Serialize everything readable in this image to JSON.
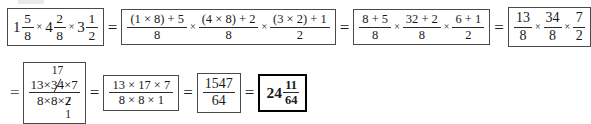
{
  "document": {
    "type": "worked-solution",
    "topic": "Multiplication of mixed numbers",
    "equals_sign": "=",
    "times_sign": "×"
  },
  "row1": {
    "step1": {
      "label": "original-expression",
      "terms": [
        {
          "whole": "1",
          "num": "5",
          "den": "8"
        },
        {
          "whole": "4",
          "num": "2",
          "den": "8"
        },
        {
          "whole": "3",
          "num": "1",
          "den": "2"
        }
      ]
    },
    "step2": {
      "label": "improper-conversion-expanded",
      "fractions": [
        {
          "num": "(1 × 8) + 5",
          "den": "8"
        },
        {
          "num": "(4 × 8) + 2",
          "den": "8"
        },
        {
          "num": "(3 × 2) + 1",
          "den": "2"
        }
      ]
    },
    "step3": {
      "label": "products-evaluated",
      "fractions": [
        {
          "num": "8 + 5",
          "den": "8"
        },
        {
          "num": "32 + 2",
          "den": "8"
        },
        {
          "num": "6 + 1",
          "den": "2"
        }
      ]
    },
    "step4": {
      "label": "improper-fractions",
      "fractions": [
        {
          "num": "13",
          "den": "8"
        },
        {
          "num": "34",
          "den": "8"
        },
        {
          "num": "7",
          "den": "2"
        }
      ]
    }
  },
  "row2": {
    "step5": {
      "label": "combined-with-cancellation",
      "numerator": {
        "first": "13",
        "times1": "×",
        "cancelled": {
          "original": "34",
          "reduced": "17",
          "position": "above"
        },
        "times2": "×",
        "last": "7"
      },
      "denominator": {
        "first": "8",
        "times1": "×",
        "second": "8",
        "times2": "×",
        "cancelled": {
          "original": "2",
          "reduced": "1",
          "position": "below"
        }
      }
    },
    "step6": {
      "label": "after-cancellation",
      "num": "13 × 17 × 7",
      "den": "8 × 8 × 1"
    },
    "step7": {
      "label": "single-improper-fraction",
      "num": "1547",
      "den": "64"
    },
    "step8": {
      "label": "final-answer-mixed-number",
      "whole": "24",
      "num": "11",
      "den": "64",
      "emphasis": "boxed-bold"
    }
  },
  "colors": {
    "ink": "#1a1a1a",
    "box_border": "#4a4a4a",
    "answer_border": "#000000",
    "page": "#ffffff"
  }
}
